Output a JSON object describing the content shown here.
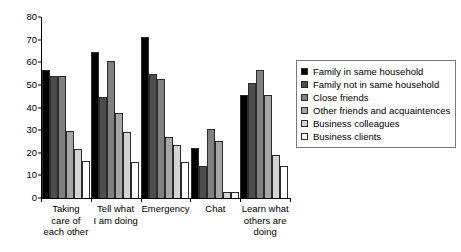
{
  "chart_data": {
    "type": "bar",
    "title": "",
    "subtitle": "",
    "xlabel": "",
    "ylabel": "",
    "ylim": [
      0,
      80
    ],
    "yticks": [
      0,
      10,
      20,
      30,
      40,
      50,
      60,
      70,
      80
    ],
    "grid": false,
    "legend_position": "right",
    "categories": [
      "Taking care of each other",
      "Tell what I am doing",
      "Emergency",
      "Chat",
      "Learn what others are doing"
    ],
    "category_label_lines": [
      [
        "Taking",
        "care of",
        "each other"
      ],
      [
        "Tell what",
        "I am doing"
      ],
      [
        "Emergency"
      ],
      [
        "Chat"
      ],
      [
        "Learn what",
        "others are",
        "doing"
      ]
    ],
    "series": [
      {
        "name": "Family in same household",
        "color": "#000000",
        "values": [
          56.5,
          64.5,
          71,
          22,
          45.5
        ]
      },
      {
        "name": "Family not in same household",
        "color": "#4d4d4d",
        "values": [
          54,
          44.5,
          55,
          14,
          51
        ]
      },
      {
        "name": "Close friends",
        "color": "#808080",
        "values": [
          54,
          60.5,
          52.5,
          30.5,
          56.5
        ]
      },
      {
        "name": "Other friends and acquaintences",
        "color": "#a6a6a6",
        "values": [
          29.5,
          37.5,
          27,
          25,
          45.5
        ]
      },
      {
        "name": "Business colleagues",
        "color": "#d4d4d4",
        "values": [
          21.5,
          29,
          23.5,
          2.5,
          19
        ]
      },
      {
        "name": "Business clients",
        "color": "#ffffff",
        "values": [
          16.5,
          16,
          16,
          2.5,
          14
        ]
      }
    ]
  }
}
